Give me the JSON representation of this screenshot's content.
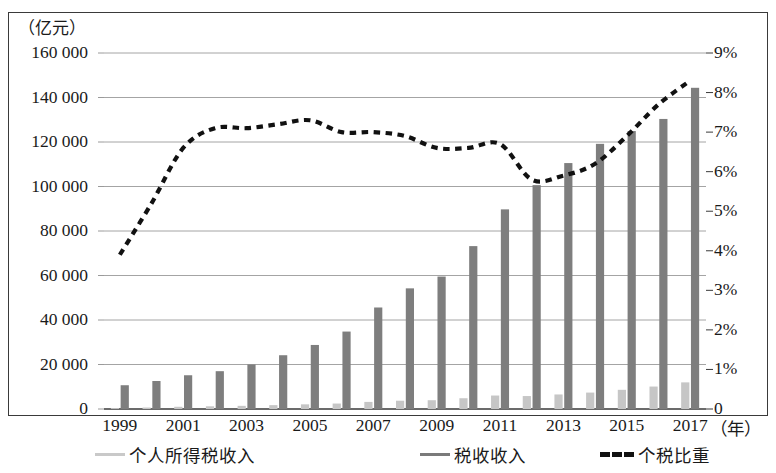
{
  "axis": {
    "unit_label": "（亿元）",
    "x_unit_label": "（年）",
    "left_ticks": [
      "160 000",
      "140 000",
      "120 000",
      "100 000",
      "80 000",
      "60 000",
      "40 000",
      "20 000",
      "0"
    ],
    "right_ticks": [
      "9%",
      "8%",
      "7%",
      "6%",
      "5%",
      "4%",
      "3%",
      "2%",
      "1%",
      "0"
    ],
    "x_ticks": [
      "1999",
      "2001",
      "2003",
      "2005",
      "2007",
      "2009",
      "2011",
      "2013",
      "2015",
      "2017"
    ]
  },
  "legend": [
    {
      "label": "个人所得税收入",
      "marker": "line-solid",
      "color": "#c9c9c9"
    },
    {
      "label": "税收收入",
      "marker": "line-solid",
      "color": "#7a7a7a"
    },
    {
      "label": "个税比重",
      "marker": "line-dotted",
      "color": "#111111"
    }
  ],
  "colors": {
    "bar_personal_tax": "#c6c6c6",
    "bar_total_tax": "#7e7e7e",
    "ratio_line": "#111111",
    "gridline": "#9a9a9a",
    "axis": "#3a3a3a"
  },
  "chart_data": {
    "type": "bar",
    "title": "",
    "subtitle": "",
    "xlabel": "（年）",
    "ylabel": "（亿元）",
    "y2label": "%",
    "ylim": [
      0,
      160000
    ],
    "y2lim": [
      0,
      9
    ],
    "grid": true,
    "legend_position": "bottom",
    "x": [
      1999,
      2000,
      2001,
      2002,
      2003,
      2004,
      2005,
      2006,
      2007,
      2008,
      2009,
      2010,
      2011,
      2012,
      2013,
      2014,
      2015,
      2016,
      2017
    ],
    "categories": [
      "1999",
      "2000",
      "2001",
      "2002",
      "2003",
      "2004",
      "2005",
      "2006",
      "2007",
      "2008",
      "2009",
      "2010",
      "2011",
      "2012",
      "2013",
      "2014",
      "2015",
      "2016",
      "2017"
    ],
    "series": [
      {
        "name": "个人所得税收入",
        "type": "bar",
        "axis": "left",
        "unit": "亿元",
        "values": [
          414,
          660,
          996,
          1211,
          1418,
          1737,
          2094,
          2453,
          3185,
          3722,
          3949,
          4837,
          6054,
          5820,
          6531,
          7377,
          8618,
          10089,
          11966
        ]
      },
      {
        "name": "税收收入",
        "type": "bar",
        "axis": "left",
        "unit": "亿元",
        "values": [
          10683,
          12582,
          15166,
          16997,
          20017,
          24166,
          28779,
          34804,
          45622,
          54224,
          59522,
          73211,
          89720,
          100614,
          110531,
          119175,
          124922,
          130361,
          144360
        ]
      },
      {
        "name": "个税比重",
        "type": "line",
        "axis": "right",
        "unit": "%",
        "style": "dotted",
        "values": [
          3.9,
          5.2,
          6.6,
          7.1,
          7.1,
          7.2,
          7.3,
          7.0,
          7.0,
          6.9,
          6.6,
          6.6,
          6.7,
          5.8,
          5.9,
          6.2,
          6.9,
          7.7,
          8.3
        ]
      }
    ]
  }
}
